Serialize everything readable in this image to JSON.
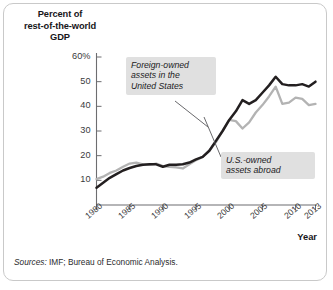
{
  "figure": {
    "y_axis_title": "Percent of rest-of-the-world GDP",
    "y_axis_title_lines": [
      "Percent of",
      "rest-of-the-world",
      "GDP"
    ],
    "x_axis_title": "Year",
    "source_note_lead": "Sources:",
    "source_note_body": " IMF; Bureau of Economic Analysis."
  },
  "annotations": [
    {
      "id": "foreign",
      "text": "Foreign-owned assets in the United States",
      "lines": [
        "Foreign-owned",
        "assets in the",
        "United States"
      ]
    },
    {
      "id": "usowned",
      "text": "U.S.-owned assets abroad",
      "lines": [
        "U.S.-owned",
        "assets abroad"
      ]
    }
  ],
  "colors": {
    "series_foreign": "#231f20",
    "series_us": "#b3b3b3",
    "callout_bg": "#e0e0e0",
    "frame": "#c9c9c9",
    "axis": "#6d6d70",
    "text": "#17161a"
  },
  "chart_data": {
    "type": "line",
    "title": "",
    "subtitle": "",
    "xlabel": "Year",
    "ylabel": "Percent of rest-of-the-world GDP",
    "xlim": [
      1980,
      2013
    ],
    "ylim": [
      0,
      60
    ],
    "yticks": [
      10,
      20,
      30,
      40,
      50,
      60
    ],
    "ytick_labels": [
      "10",
      "20",
      "30",
      "40",
      "50",
      "60%"
    ],
    "xticks": [
      1980,
      1985,
      1990,
      1995,
      2000,
      2005,
      2010,
      2013
    ],
    "xtick_labels": [
      "1980",
      "1985",
      "1990",
      "1995",
      "2000",
      "2005",
      "2010",
      "2013"
    ],
    "grid": false,
    "legend": "annotations-inline",
    "x": [
      1980,
      1981,
      1982,
      1983,
      1984,
      1985,
      1986,
      1987,
      1988,
      1989,
      1990,
      1991,
      1992,
      1993,
      1994,
      1995,
      1996,
      1997,
      1998,
      1999,
      2000,
      2001,
      2002,
      2003,
      2004,
      2005,
      2006,
      2007,
      2008,
      2009,
      2010,
      2011,
      2012,
      2013
    ],
    "series": [
      {
        "name": "Foreign-owned assets in the United States",
        "color": "#231f20",
        "values": [
          7,
          9,
          11,
          12.5,
          14,
          15,
          15.8,
          16.3,
          16.5,
          16.5,
          15.5,
          16.3,
          16.3,
          16.5,
          17.2,
          18.5,
          19.5,
          22,
          26,
          30,
          34.5,
          38,
          42.5,
          41,
          42.5,
          45.5,
          48.5,
          52,
          49,
          48.5,
          48.5,
          49,
          48,
          50
        ]
      },
      {
        "name": "U.S.-owned assets abroad",
        "color": "#b3b3b3",
        "values": [
          10.5,
          11.5,
          13,
          14,
          15.5,
          16.8,
          17.2,
          16.5,
          16.3,
          16.8,
          15.8,
          15.5,
          15.3,
          14.8,
          16.5,
          18.2,
          19.5,
          22,
          25.5,
          30,
          34.5,
          34,
          31,
          33.5,
          37.5,
          40.5,
          44,
          48,
          41,
          41.5,
          43.5,
          43,
          40.5,
          41
        ]
      }
    ]
  }
}
